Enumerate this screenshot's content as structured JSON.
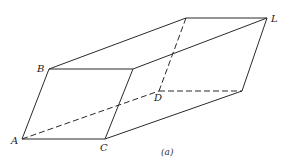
{
  "figure": {
    "caption": "(a)",
    "labels": {
      "A": "A",
      "B": "B",
      "C": "C",
      "D": "D",
      "L": "L"
    },
    "vertices": {
      "A": [
        22,
        139
      ],
      "B": [
        49,
        69
      ],
      "C": [
        105,
        139
      ],
      "F": [
        133,
        69
      ],
      "D": [
        159,
        91
      ],
      "E": [
        186,
        18
      ],
      "G": [
        242,
        91
      ],
      "L": [
        267,
        18
      ]
    },
    "colors": {
      "line": "#2a2a2a",
      "background": "#ffffff"
    }
  }
}
